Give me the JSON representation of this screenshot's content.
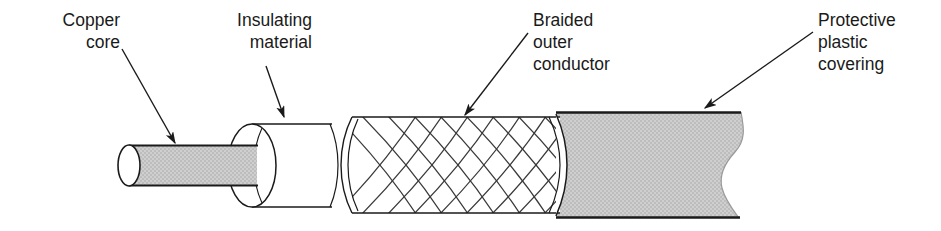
{
  "figure": {
    "width": 941,
    "height": 231,
    "background": "#ffffff"
  },
  "colors": {
    "stroke": "#1a1a1a",
    "text": "#1a1a1a",
    "copper_core_fill": "#c6c6c6",
    "insulation_fill": "#ffffff",
    "braid_fill": "#ffffff",
    "braid_strand": "#3a3a3a",
    "plastic_fill": "#c6c6c6",
    "page": "#ffffff"
  },
  "labels": {
    "copper_core": {
      "name": "Copper core",
      "lines": [
        "Copper",
        "core"
      ],
      "line1": "Copper",
      "line2": "core",
      "align": "right"
    },
    "insulating_material": {
      "name": "Insulating material",
      "lines": [
        "Insulating",
        "material"
      ],
      "line1": "Insulating",
      "line2": "material",
      "align": "right"
    },
    "braided_outer_conductor": {
      "name": "Braided outer conductor",
      "lines": [
        "Braided",
        "outer",
        "conductor"
      ],
      "line1": "Braided",
      "line2": "outer",
      "line3": "conductor",
      "align": "left"
    },
    "protective_plastic_covering": {
      "name": "Protective plastic covering",
      "lines": [
        "Protective",
        "plastic",
        "covering"
      ],
      "line1": "Protective",
      "line2": "plastic",
      "line3": "covering",
      "align": "left"
    }
  },
  "parts": [
    {
      "id": "copper-core",
      "label": "Copper core",
      "fill": "#c6c6c6"
    },
    {
      "id": "insulating-material",
      "label": "Insulating material",
      "fill": "#ffffff"
    },
    {
      "id": "braided-outer-conductor",
      "label": "Braided outer conductor",
      "fill": "#ffffff"
    },
    {
      "id": "protective-plastic-covering",
      "label": "Protective plastic covering",
      "fill": "#c6c6c6"
    }
  ],
  "leader_lines": [
    {
      "for": "copper-core",
      "from": [
        122,
        49
      ],
      "to": [
        177,
        146
      ]
    },
    {
      "for": "insulating-material",
      "from": [
        266,
        66
      ],
      "to": [
        286,
        120
      ]
    },
    {
      "for": "braided-outer-conductor",
      "from": [
        528,
        33
      ],
      "to": [
        462,
        118
      ]
    },
    {
      "for": "protective-plastic-covering",
      "from": [
        813,
        32
      ],
      "to": [
        702,
        111
      ]
    }
  ]
}
